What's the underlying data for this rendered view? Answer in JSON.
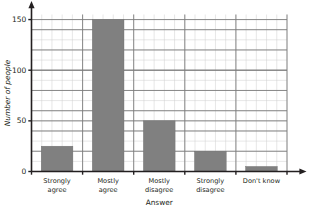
{
  "chart_data": {
    "type": "bar",
    "title": "",
    "xlabel": "Answer",
    "ylabel": "Number of people",
    "categories": [
      "Strongly agree",
      "Mostly agree",
      "Mostly disagree",
      "Strongly disagree",
      "Don't know"
    ],
    "category_lines": [
      [
        "Strongly",
        "agree"
      ],
      [
        "Mostly",
        "agree"
      ],
      [
        "Mostly",
        "disagree"
      ],
      [
        "Strongly",
        "disagree"
      ],
      [
        "Don't know"
      ]
    ],
    "values": [
      25,
      150,
      50,
      20,
      5
    ],
    "ylim": [
      0,
      155
    ],
    "ytick_labels": [
      "0",
      "50",
      "100",
      "150"
    ],
    "ytick_values": [
      0,
      50,
      100,
      150
    ],
    "y_minor_step": 10,
    "grid": true,
    "legend": false,
    "bar_color": "#808080",
    "grid_major_color": "#7d7d7d",
    "grid_minor_color": "#cfcfcf",
    "axis_color": "#231f20"
  }
}
